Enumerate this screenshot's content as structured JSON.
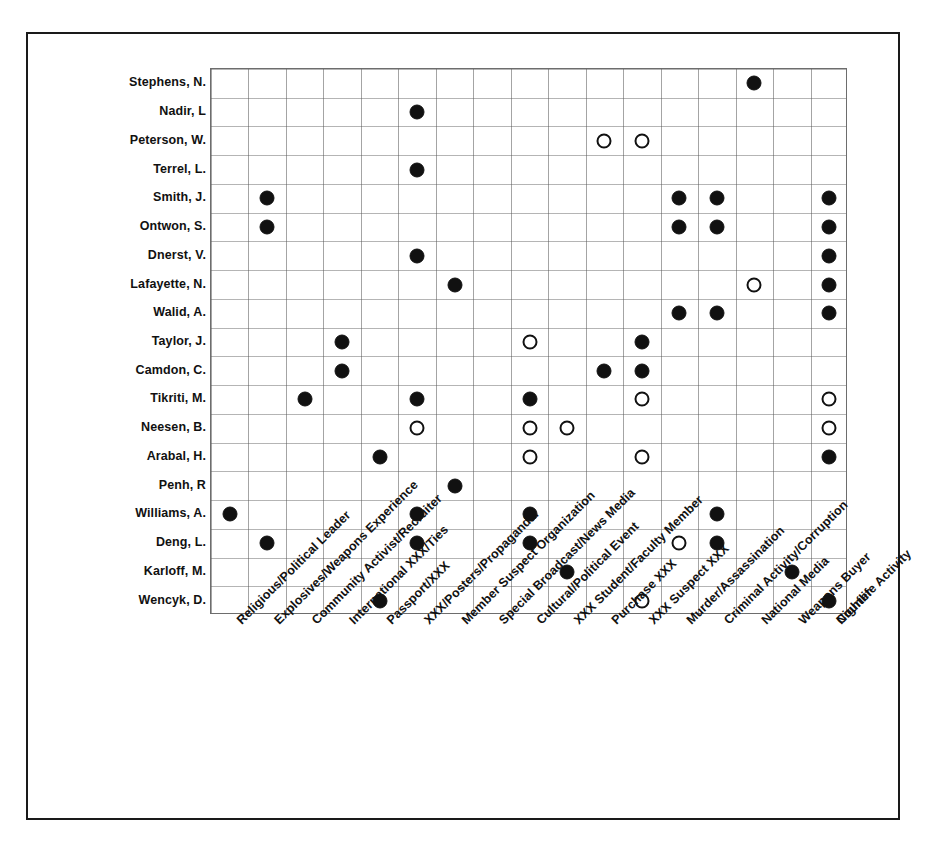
{
  "figure": {
    "marker_legend": {
      "filled": "confirmed-association",
      "open": "suspected-association"
    },
    "colors": {
      "frame": "#1a1a1a",
      "grid": "#5a5a5a",
      "marker": "#111111",
      "background": "#ffffff"
    }
  },
  "chart_data": {
    "type": "scatter",
    "title": "",
    "xlabel": "",
    "ylabel": "",
    "grid": true,
    "legend_position": "none",
    "marker_types": [
      "filled",
      "open"
    ],
    "rows": [
      "Stephens, N.",
      "Nadir, L",
      "Peterson, W.",
      "Terrel, L.",
      "Smith, J.",
      "Ontwon, S.",
      "Dnerst, V.",
      "Lafayette, N.",
      "Walid, A.",
      "Taylor, J.",
      "Camdon, C.",
      "Tikriti, M.",
      "Neesen, B.",
      "Arabal, H.",
      "Penh, R",
      "Williams, A.",
      "Deng, L.",
      "Karloff, M.",
      "Wencyk, D."
    ],
    "columns": [
      "Religious/Political Leader",
      "Explosives/Weapons Experience",
      "Community Activist/Recruiter",
      "International XXX/Ties",
      "Passport/XXX",
      "XXX/Posters/Propaganda.",
      "Member Suspect Organization",
      "Special Broadcast/News Media",
      "Cultural/Political Event",
      "XXX Student/Faculty Member",
      "Purchase XXX",
      "XXX Suspect XXX",
      "Murder/Assassination",
      "Criminal Activity/Corruption",
      "National Media",
      "Weapons Buyer",
      "Courier",
      "Nightlife Activity"
    ],
    "points": [
      {
        "row": "Stephens, N.",
        "column": "National Media",
        "marker": "filled"
      },
      {
        "row": "Nadir, L",
        "column": "XXX/Posters/Propaganda.",
        "marker": "filled"
      },
      {
        "row": "Peterson, W.",
        "column": "Purchase XXX",
        "marker": "open"
      },
      {
        "row": "Peterson, W.",
        "column": "XXX Suspect XXX",
        "marker": "open"
      },
      {
        "row": "Terrel, L.",
        "column": "XXX/Posters/Propaganda.",
        "marker": "filled"
      },
      {
        "row": "Smith, J.",
        "column": "Explosives/Weapons Experience",
        "marker": "filled"
      },
      {
        "row": "Smith, J.",
        "column": "Murder/Assassination",
        "marker": "filled"
      },
      {
        "row": "Smith, J.",
        "column": "Criminal Activity/Corruption",
        "marker": "filled"
      },
      {
        "row": "Smith, J.",
        "column": "Nightlife Activity",
        "marker": "filled"
      },
      {
        "row": "Ontwon, S.",
        "column": "Explosives/Weapons Experience",
        "marker": "filled"
      },
      {
        "row": "Ontwon, S.",
        "column": "Murder/Assassination",
        "marker": "filled"
      },
      {
        "row": "Ontwon, S.",
        "column": "Criminal Activity/Corruption",
        "marker": "filled"
      },
      {
        "row": "Ontwon, S.",
        "column": "Nightlife Activity",
        "marker": "filled"
      },
      {
        "row": "Dnerst, V.",
        "column": "XXX/Posters/Propaganda.",
        "marker": "filled"
      },
      {
        "row": "Dnerst, V.",
        "column": "Nightlife Activity",
        "marker": "filled"
      },
      {
        "row": "Lafayette, N.",
        "column": "Member Suspect Organization",
        "marker": "filled"
      },
      {
        "row": "Lafayette, N.",
        "column": "National Media",
        "marker": "open"
      },
      {
        "row": "Lafayette, N.",
        "column": "Nightlife Activity",
        "marker": "filled"
      },
      {
        "row": "Walid, A.",
        "column": "Murder/Assassination",
        "marker": "filled"
      },
      {
        "row": "Walid, A.",
        "column": "Criminal Activity/Corruption",
        "marker": "filled"
      },
      {
        "row": "Walid, A.",
        "column": "Nightlife Activity",
        "marker": "filled"
      },
      {
        "row": "Taylor, J.",
        "column": "International XXX/Ties",
        "marker": "filled"
      },
      {
        "row": "Taylor, J.",
        "column": "Cultural/Political Event",
        "marker": "open"
      },
      {
        "row": "Taylor, J.",
        "column": "XXX Suspect XXX",
        "marker": "filled"
      },
      {
        "row": "Camdon, C.",
        "column": "International XXX/Ties",
        "marker": "filled"
      },
      {
        "row": "Camdon, C.",
        "column": "Purchase XXX",
        "marker": "filled"
      },
      {
        "row": "Camdon, C.",
        "column": "XXX Suspect XXX",
        "marker": "filled"
      },
      {
        "row": "Tikriti, M.",
        "column": "Community Activist/Recruiter",
        "marker": "filled"
      },
      {
        "row": "Tikriti, M.",
        "column": "XXX/Posters/Propaganda.",
        "marker": "filled"
      },
      {
        "row": "Tikriti, M.",
        "column": "Cultural/Political Event",
        "marker": "filled"
      },
      {
        "row": "Tikriti, M.",
        "column": "XXX Suspect XXX",
        "marker": "open"
      },
      {
        "row": "Tikriti, M.",
        "column": "Courier",
        "marker": "open"
      },
      {
        "row": "Neesen, B.",
        "column": "XXX/Posters/Propaganda.",
        "marker": "open"
      },
      {
        "row": "Neesen, B.",
        "column": "Cultural/Political Event",
        "marker": "open"
      },
      {
        "row": "Neesen, B.",
        "column": "XXX Student/Faculty Member",
        "marker": "open"
      },
      {
        "row": "Neesen, B.",
        "column": "Courier",
        "marker": "open"
      },
      {
        "row": "Arabal, H.",
        "column": "Passport/XXX",
        "marker": "filled"
      },
      {
        "row": "Arabal, H.",
        "column": "Cultural/Political Event",
        "marker": "open"
      },
      {
        "row": "Arabal, H.",
        "column": "XXX Suspect XXX",
        "marker": "open"
      },
      {
        "row": "Arabal, H.",
        "column": "Courier",
        "marker": "filled"
      },
      {
        "row": "Penh, R",
        "column": "Member Suspect Organization",
        "marker": "filled"
      },
      {
        "row": "Williams, A.",
        "column": "Religious/Political Leader",
        "marker": "filled"
      },
      {
        "row": "Williams, A.",
        "column": "XXX/Posters/Propaganda.",
        "marker": "filled"
      },
      {
        "row": "Williams, A.",
        "column": "Cultural/Political Event",
        "marker": "filled"
      },
      {
        "row": "Williams, A.",
        "column": "Criminal Activity/Corruption",
        "marker": "filled"
      },
      {
        "row": "Deng, L.",
        "column": "Explosives/Weapons Experience",
        "marker": "filled"
      },
      {
        "row": "Deng, L.",
        "column": "XXX/Posters/Propaganda.",
        "marker": "filled"
      },
      {
        "row": "Deng, L.",
        "column": "Cultural/Political Event",
        "marker": "filled"
      },
      {
        "row": "Deng, L.",
        "column": "Murder/Assassination",
        "marker": "open"
      },
      {
        "row": "Deng, L.",
        "column": "Criminal Activity/Corruption",
        "marker": "filled"
      },
      {
        "row": "Karloff, M.",
        "column": "XXX Student/Faculty Member",
        "marker": "filled"
      },
      {
        "row": "Karloff, M.",
        "column": "Weapons Buyer",
        "marker": "filled"
      },
      {
        "row": "Wencyk, D.",
        "column": "Passport/XXX",
        "marker": "filled"
      },
      {
        "row": "Wencyk, D.",
        "column": "XXX Suspect XXX",
        "marker": "open"
      },
      {
        "row": "Wencyk, D.",
        "column": "Courier",
        "marker": "filled"
      }
    ]
  }
}
